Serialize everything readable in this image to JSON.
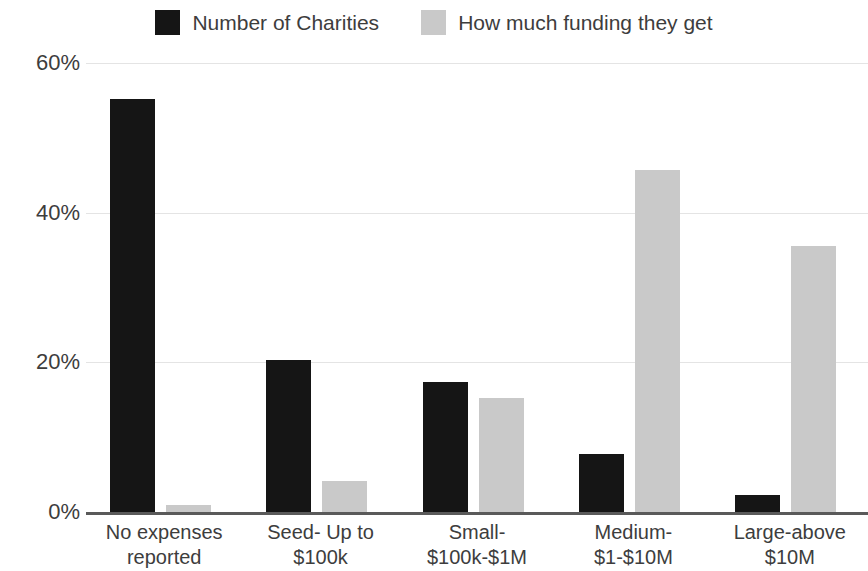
{
  "chart_data": {
    "type": "bar",
    "title": "",
    "subtitle": "",
    "xlabel": "",
    "ylabel": "",
    "categories": [
      "No expenses reported",
      "Seed- Up to $100k",
      "Small- $100k-$1M",
      "Medium- $1-$10M",
      "Large-above $10M"
    ],
    "category_lines": [
      [
        "No expenses",
        "reported"
      ],
      [
        "Seed- Up to",
        "$100k"
      ],
      [
        "Small-",
        "$100k-$1M"
      ],
      [
        "Medium-",
        "$1-$10M"
      ],
      [
        "Large-above",
        "$10M"
      ]
    ],
    "series": [
      {
        "name": "Number of Charities",
        "color": "#151515",
        "values": [
          55.2,
          20.3,
          17.4,
          7.8,
          2.3
        ]
      },
      {
        "name": "How much funding they get",
        "color": "#c9c9c9",
        "values": [
          1.0,
          4.2,
          15.3,
          45.7,
          35.6
        ]
      }
    ],
    "ylim": [
      0,
      60
    ],
    "yticks": [
      0,
      20,
      40,
      60
    ],
    "ytick_labels": [
      "0%",
      "20%",
      "40%",
      "60%"
    ],
    "grid": true,
    "grid_color": "#e4e4e4",
    "legend_position": "top-center",
    "value_suffix": "%"
  },
  "legend": {
    "items": [
      {
        "label": "Number of Charities",
        "color": "#151515"
      },
      {
        "label": "How much funding they get",
        "color": "#c9c9c9"
      }
    ]
  },
  "axis": {
    "baseline_color": "#5a5a5a"
  }
}
